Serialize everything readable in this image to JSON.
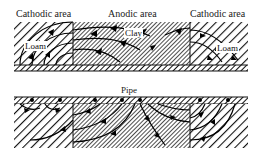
{
  "labels": {
    "left_area": "Cathodic area",
    "middle_area": "Anodic area",
    "right_area": "Cathodic area",
    "pipe": "Pipe"
  },
  "soil_tags": {
    "left": "Loam",
    "middle": "Clay",
    "right": "Loam"
  },
  "colors": {
    "ink": "#111111",
    "background": "#ffffff"
  }
}
